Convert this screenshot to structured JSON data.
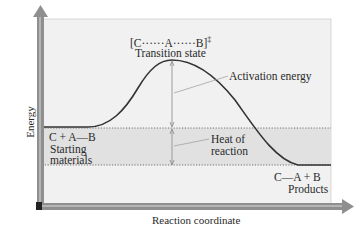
{
  "diagram": {
    "type": "reaction-energy-diagram",
    "axes": {
      "y_label": "Energy",
      "x_label": "Reaction coordinate"
    },
    "transition_state": {
      "formula": "[C······A······B]",
      "superscript": "‡",
      "label": "Transition state"
    },
    "starting_materials": {
      "formula": "C + A—B",
      "label_line1": "Starting",
      "label_line2": "materials"
    },
    "products": {
      "formula": "C—A + B",
      "label": "Products"
    },
    "annotations": {
      "activation_energy": "Activation energy",
      "heat_of_reaction_line1": "Heat of",
      "heat_of_reaction_line2": "reaction"
    },
    "colors": {
      "panel": "#f1f1f1",
      "band": "#e2e2e2",
      "axis": "#8a8a8a",
      "curve": "#3a3a3a"
    }
  }
}
